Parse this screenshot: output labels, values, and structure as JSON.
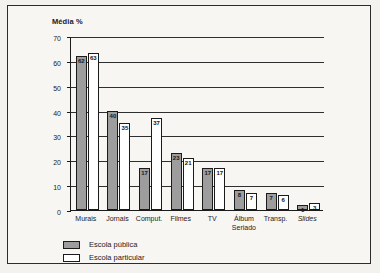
{
  "chart_data": {
    "type": "bar",
    "title": "",
    "ylabel": "Média %",
    "xlabel": "",
    "ylim": [
      0,
      70
    ],
    "yticks": [
      0,
      10,
      20,
      30,
      40,
      50,
      60,
      70
    ],
    "ytick_labels": [
      "0",
      "10",
      "20",
      "30",
      "40",
      "50",
      "60",
      "70"
    ],
    "grid": true,
    "legend_position": "bottom-left",
    "categories": [
      "Murais",
      "Jornais",
      "Comput.",
      "Filmes",
      "TV",
      "Álbum\nSeriado",
      "Transp.",
      "Slides"
    ],
    "series": [
      {
        "name": "Escola pública",
        "color": "#9d9d9d",
        "values": [
          62,
          40,
          17,
          23,
          17,
          8,
          7,
          1
        ]
      },
      {
        "name": "Escola particular",
        "color": "#ffffff",
        "values": [
          63,
          35,
          37,
          21,
          17,
          7,
          6,
          3
        ]
      }
    ]
  },
  "legend": {
    "items": [
      {
        "label": "Escola pública",
        "swatch": "public"
      },
      {
        "label": "Escola particular",
        "swatch": "private"
      }
    ]
  }
}
